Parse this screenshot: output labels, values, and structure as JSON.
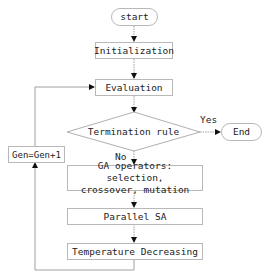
{
  "flowchart": {
    "nodes": {
      "start": "start",
      "initialization": "Initialization",
      "evaluation": "Evaluation",
      "termination": "Termination rule",
      "end": "End",
      "gen_increment": "Gen=Gen+1",
      "ga_operators_line1": "GA operators: selection,",
      "ga_operators_line2": "crossover, mutation",
      "parallel_sa": "Parallel SA",
      "temperature": "Temperature Decreasing"
    },
    "edge_labels": {
      "yes": "Yes",
      "no": "No"
    },
    "colors": {
      "border": "#b8b8b8",
      "line": "#999999",
      "arrow": "#111111",
      "text": "#222222"
    }
  }
}
